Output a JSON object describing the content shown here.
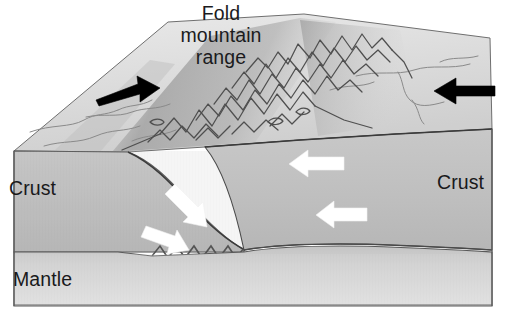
{
  "diagram": {
    "kind": "geology-block-diagram",
    "title": {
      "line1": "Fold",
      "line2": "mountain",
      "line3": "range",
      "full": "Fold mountain range"
    },
    "labels": {
      "crust_left": "Crust",
      "crust_right": "Crust",
      "mantle": "Mantle"
    },
    "arrows": {
      "black_left": {
        "name": "plate-motion-arrow-left",
        "direction": "right",
        "color": "#000000",
        "description": "black arrow on top surface pointing right (inward)"
      },
      "black_right": {
        "name": "plate-motion-arrow-right",
        "direction": "left",
        "color": "#000000",
        "description": "black arrow on top surface pointing left (inward)"
      },
      "white_upper_right": {
        "name": "compression-arrow-upper-right",
        "direction": "left",
        "color": "#ffffff"
      },
      "white_lower_right": {
        "name": "compression-arrow-lower-right",
        "direction": "left",
        "color": "#ffffff"
      },
      "white_slab_upper": {
        "name": "subduction-arrow-upper",
        "direction": "down-right",
        "color": "#ffffff"
      },
      "white_slab_lower": {
        "name": "subduction-arrow-lower",
        "direction": "down-right",
        "color": "#ffffff"
      }
    },
    "colors": {
      "crust_face": "#bdbdbd",
      "crust_face_dark": "#b2b2b2",
      "top_surface_light": "#e4e4e4",
      "top_surface_shadow": "#bfbfbf",
      "mantle_band": "#cfcfcf",
      "outline": "#4a4a4a",
      "outline_dark": "#2d2d2d",
      "arrow_black": "#000000",
      "arrow_white": "#ffffff",
      "text": "#19191b",
      "background": "#ffffff"
    }
  }
}
